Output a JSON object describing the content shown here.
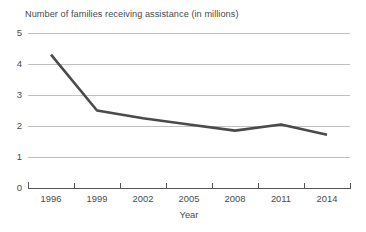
{
  "chart_data": {
    "type": "line",
    "title": "Number of families receiving assistance (in millions)",
    "xlabel": "Year",
    "ylabel": "",
    "categories": [
      "1996",
      "1999",
      "2002",
      "2005",
      "2008",
      "2011",
      "2014"
    ],
    "x": [
      1996,
      1999,
      2002,
      2005,
      2008,
      2011,
      2014
    ],
    "values": [
      4.3,
      2.5,
      2.25,
      2.05,
      1.85,
      2.05,
      1.72
    ],
    "series": [
      {
        "name": "Number of families receiving assistance (in millions)",
        "values": [
          4.3,
          2.5,
          2.25,
          2.05,
          1.85,
          2.05,
          1.72
        ]
      }
    ],
    "ylim": [
      0,
      5
    ],
    "yticks": [
      "0",
      "1",
      "2",
      "3",
      "4",
      "5"
    ],
    "xticks": [
      "1996",
      "1999",
      "2002",
      "2005",
      "2008",
      "2011",
      "2014"
    ],
    "grid": true,
    "grid_axis": "y",
    "legend": false,
    "line_color": "#4a4a4a",
    "grid_color": "#b9b9b9",
    "axis_color": "#555555",
    "background_color": "#ffffff",
    "text_color": "#4a4a4a"
  }
}
